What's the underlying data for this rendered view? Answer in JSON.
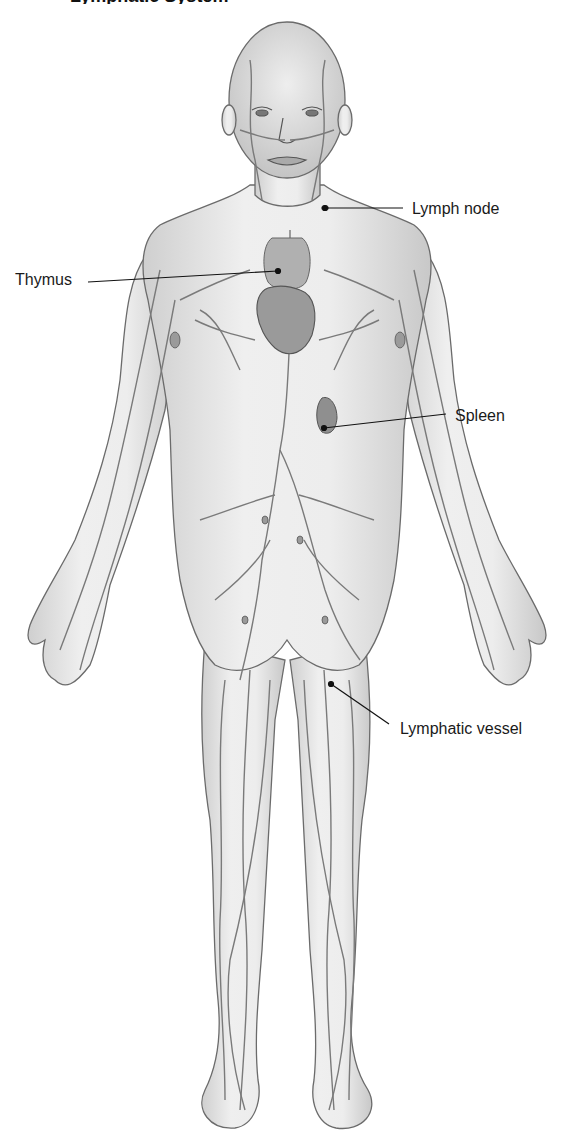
{
  "diagram": {
    "title_partial": "Lymphatic System",
    "labels": [
      {
        "id": "lymph-node",
        "text": "Lymph node",
        "x": 412,
        "y": 200
      },
      {
        "id": "thymus",
        "text": "Thymus",
        "x": 15,
        "y": 271
      },
      {
        "id": "spleen",
        "text": "Spleen",
        "x": 455,
        "y": 407
      },
      {
        "id": "lymphatic-vessel",
        "text": "Lymphatic vessel",
        "x": 400,
        "y": 720
      }
    ],
    "colors": {
      "skin": "#e6e6e6",
      "outline": "#6b6b6b",
      "vessel": "#7a7a7a",
      "organ": "#9a9a9a",
      "leader": "#111111",
      "text": "#1a1a1a"
    }
  }
}
